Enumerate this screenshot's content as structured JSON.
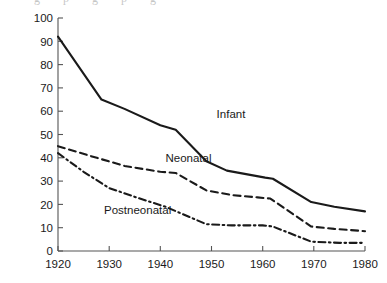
{
  "chart_data": {
    "type": "line",
    "title": "",
    "subtitle": "",
    "xlabel": "",
    "ylabel": "",
    "x": [
      1920,
      1930,
      1940,
      1950,
      1960,
      1970,
      1980
    ],
    "xlim": [
      1920,
      1980
    ],
    "ylim": [
      0,
      100
    ],
    "grid": false,
    "legend_position": "inline-annotation",
    "xticks": [
      "1920",
      "1930",
      "1940",
      "1950",
      "1960",
      "1970",
      "1980"
    ],
    "yticks": [
      "0",
      "10",
      "20",
      "30",
      "40",
      "50",
      "60",
      "70",
      "80",
      "90",
      "100"
    ],
    "series": [
      {
        "name": "Infant",
        "style": "solid",
        "color": "#1a1a1a",
        "values": [
          92,
          65,
          54,
          38,
          31.5,
          21,
          17
        ],
        "label_x": 1951,
        "label_y": 57
      },
      {
        "name": "Neonatal",
        "style": "dashed",
        "color": "#1a1a1a",
        "values": [
          45,
          38,
          33.5,
          25,
          22,
          10.5,
          8.5
        ],
        "label_x": 1941,
        "label_y": 38
      },
      {
        "name": "Postneonatal",
        "style": "dash-dot",
        "color": "#1a1a1a",
        "values": [
          42,
          27,
          19,
          11.5,
          10.5,
          4,
          3.5
        ],
        "label_x": 1929,
        "label_y": 16
      }
    ],
    "detail_points": {
      "Infant": [
        [
          1920,
          92
        ],
        [
          1928.5,
          65
        ],
        [
          1933,
          61
        ],
        [
          1940,
          54
        ],
        [
          1943,
          52
        ],
        [
          1949,
          38.5
        ],
        [
          1953,
          34.5
        ],
        [
          1960.5,
          31.5
        ],
        [
          1962,
          31
        ],
        [
          1969.5,
          21
        ],
        [
          1974,
          19
        ],
        [
          1980,
          17
        ]
      ],
      "Neonatal": [
        [
          1920,
          45
        ],
        [
          1926,
          41
        ],
        [
          1933,
          36.5
        ],
        [
          1940,
          34
        ],
        [
          1943,
          33.5
        ],
        [
          1949,
          26
        ],
        [
          1954,
          24
        ],
        [
          1959,
          23
        ],
        [
          1961.5,
          22.5
        ],
        [
          1969.5,
          10.5
        ],
        [
          1974,
          9.5
        ],
        [
          1980,
          8.5
        ]
      ],
      "Postneonatal": [
        [
          1920,
          42
        ],
        [
          1925,
          34
        ],
        [
          1930,
          27
        ],
        [
          1936,
          22.5
        ],
        [
          1941,
          19
        ],
        [
          1949,
          11.5
        ],
        [
          1954,
          11
        ],
        [
          1960,
          11
        ],
        [
          1962,
          10.5
        ],
        [
          1969.5,
          4
        ],
        [
          1975,
          3.5
        ],
        [
          1980,
          3.5
        ]
      ]
    }
  },
  "plot_geometry": {
    "left": 58,
    "right": 365,
    "top": 18,
    "bottom": 251
  },
  "axis_color": "#555555",
  "line_color": "#1a1a1a"
}
